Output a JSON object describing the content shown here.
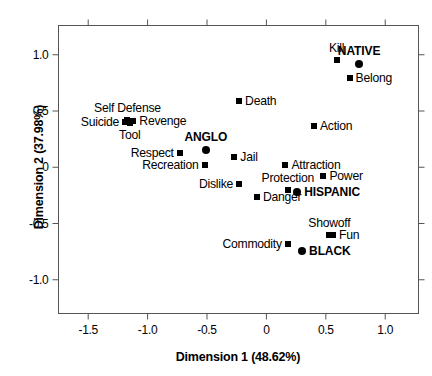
{
  "chart_data": {
    "type": "scatter",
    "title": "",
    "xlabel": "Dimension 1 (48.62%)",
    "ylabel": "Dimension 2 (37.98%)",
    "xlim": [
      -1.75,
      1.28
    ],
    "ylim": [
      -1.3,
      1.26
    ],
    "xticks": [
      -1.5,
      -1.0,
      -0.5,
      0,
      0.5,
      1.0
    ],
    "xticklabels": [
      "-1.5",
      "-1.0",
      "-0.5",
      "0",
      "0.5",
      "1.0"
    ],
    "yticks": [
      1.0,
      0.5,
      0,
      -0.5,
      -1.0
    ],
    "yticklabels": [
      "1.0",
      "0.5",
      "0",
      "-0.5",
      "-1.0"
    ],
    "grid": false,
    "legend": "none",
    "marker_color": "#000000",
    "series": [
      {
        "name": "Attributes",
        "marker": "square",
        "points": [
          {
            "label": "Kill",
            "x": 0.59,
            "y": 0.95,
            "label_pos": "above"
          },
          {
            "label": "Belong",
            "x": 0.7,
            "y": 0.79,
            "label_pos": "right"
          },
          {
            "label": "Death",
            "x": -0.23,
            "y": 0.59,
            "label_pos": "right"
          },
          {
            "label": "Action",
            "x": 0.4,
            "y": 0.37,
            "label_pos": "right"
          },
          {
            "label": "Self Defense",
            "x": -1.17,
            "y": 0.42,
            "label_pos": "above"
          },
          {
            "label": "Suicide",
            "x": -1.19,
            "y": 0.4,
            "label_pos": "left"
          },
          {
            "label": "Revenge",
            "x": -1.12,
            "y": 0.41,
            "label_pos": "right"
          },
          {
            "label": "Tool",
            "x": -1.15,
            "y": 0.39,
            "label_pos": "below"
          },
          {
            "label": "Respect",
            "x": -0.73,
            "y": 0.13,
            "label_pos": "left"
          },
          {
            "label": "Jail",
            "x": -0.27,
            "y": 0.09,
            "label_pos": "right"
          },
          {
            "label": "Recreation",
            "x": -0.52,
            "y": 0.02,
            "label_pos": "left"
          },
          {
            "label": "Attraction",
            "x": 0.16,
            "y": 0.02,
            "label_pos": "right"
          },
          {
            "label": "Power",
            "x": 0.48,
            "y": -0.08,
            "label_pos": "right"
          },
          {
            "label": "Dislike",
            "x": -0.23,
            "y": -0.15,
            "label_pos": "left"
          },
          {
            "label": "Protection",
            "x": 0.18,
            "y": -0.2,
            "label_pos": "above"
          },
          {
            "label": "Danger",
            "x": -0.08,
            "y": -0.26,
            "label_pos": "right"
          },
          {
            "label": "Showoff",
            "x": 0.53,
            "y": -0.6,
            "label_pos": "above"
          },
          {
            "label": "Fun",
            "x": 0.56,
            "y": -0.6,
            "label_pos": "right"
          },
          {
            "label": "Commodity",
            "x": 0.18,
            "y": -0.68,
            "label_pos": "left"
          }
        ]
      },
      {
        "name": "Ethnic Groups",
        "marker": "circle",
        "points": [
          {
            "label": "NATIVE",
            "x": 0.78,
            "y": 0.92,
            "label_pos": "above"
          },
          {
            "label": "ANGLO",
            "x": -0.51,
            "y": 0.15,
            "label_pos": "above"
          },
          {
            "label": "HISPANIC",
            "x": 0.26,
            "y": -0.22,
            "label_pos": "right"
          },
          {
            "label": "BLACK",
            "x": 0.3,
            "y": -0.74,
            "label_pos": "right"
          }
        ]
      }
    ]
  }
}
